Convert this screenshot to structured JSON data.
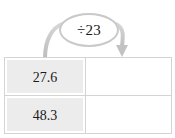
{
  "figure": {
    "type": "function-machine-table",
    "operation": {
      "label": "÷23",
      "symbol": "÷",
      "operand": "23",
      "bubble_border_color": "#c9c9c9",
      "bubble_fill_color": "#ffffff"
    },
    "arrow": {
      "name": "curved-arrow",
      "color": "#c6c6c6",
      "direction": "left-to-right",
      "head": "down-right"
    }
  },
  "table": {
    "given_column_bg": "#ececed",
    "answer_column_bg": "#ffffff",
    "border_color": "#d4d4d4",
    "rows": [
      {
        "given": "27.6",
        "answer": ""
      },
      {
        "given": "48.3",
        "answer": ""
      }
    ]
  }
}
